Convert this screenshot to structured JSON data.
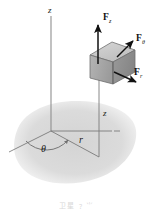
{
  "figure": {
    "caption": "卫星 ﹖ ⺌",
    "background_color": "#ffffff",
    "ground_shadow_color": "#d8d8d8",
    "axis_color": "#8a8a8a",
    "vector_color": "#111111",
    "block_top_color": "#c9c9c9",
    "block_front_color": "#a8a8a8",
    "block_side_color": "#8f8f8f",
    "block_edge_color": "#6e6e6e"
  },
  "labels": {
    "axis_z": "z",
    "height_z": "z",
    "radius_r": "r",
    "angle_theta": "θ",
    "force_z": "F",
    "force_z_sub": "z",
    "force_theta": "F",
    "force_theta_sub": "θ",
    "force_r": "F",
    "force_r_sub": "r"
  },
  "vectors": [
    {
      "name": "F_z",
      "label": "F",
      "subscript": "z",
      "direction": "up",
      "x1": 98,
      "y1": 62,
      "x2": 98,
      "y2": 23
    },
    {
      "name": "F_theta",
      "label": "F",
      "subscript": "θ",
      "direction": "up-right",
      "x1": 118,
      "y1": 56,
      "x2": 134,
      "y2": 40
    },
    {
      "name": "F_r",
      "label": "F",
      "subscript": "r",
      "direction": "down-right",
      "x1": 113,
      "y1": 72,
      "x2": 136,
      "y2": 82
    }
  ],
  "axes": {
    "vertical_axis": {
      "name": "z-axis",
      "x": 51,
      "y_top": 16,
      "y_bottom": 131
    },
    "radial_line": {
      "name": "r-line",
      "x1": 51,
      "y1": 131,
      "x2": 99,
      "y2": 156
    },
    "theta_line": {
      "name": "theta-ref-line",
      "x1": 51,
      "y1": 131,
      "x2": 9,
      "y2": 152
    },
    "horizontal_line": {
      "name": "plane-horizontal",
      "x1": 51,
      "y1": 131,
      "x2": 118,
      "y2": 131
    },
    "drop_line": {
      "name": "vertical-drop-line",
      "x": 99,
      "y_top": 80,
      "y_bottom": 156
    }
  },
  "block": {
    "name": "differential-element",
    "top_face": "112,42 135,50 113,62 90,55",
    "front_face": "90,55 113,62 113,84 90,78",
    "side_face": "113,62 135,50 135,72 113,84"
  }
}
